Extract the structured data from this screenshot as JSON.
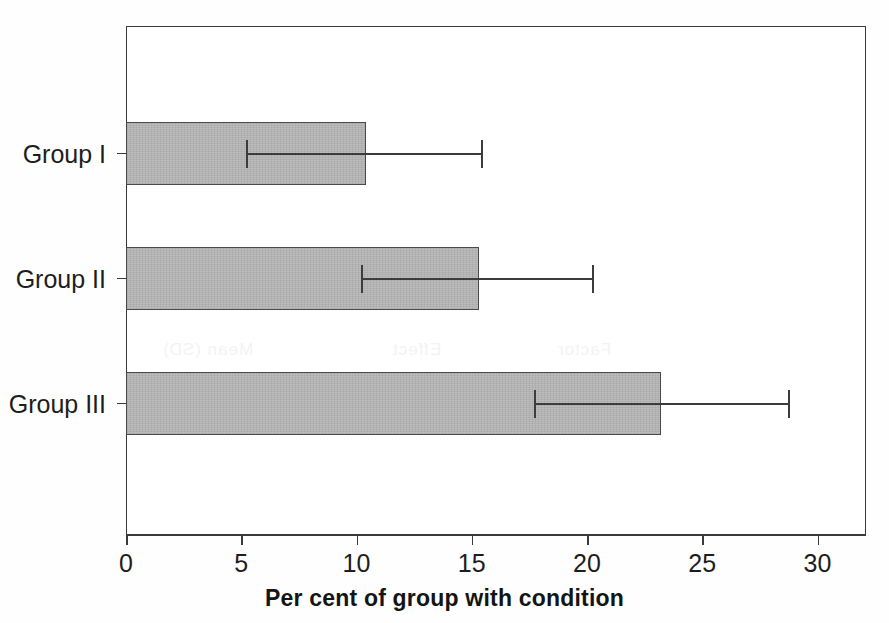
{
  "chart_data": {
    "type": "bar",
    "orientation": "horizontal",
    "title": "",
    "xlabel": "Per cent of group with condition",
    "ylabel": "",
    "categories": [
      "Group I",
      "Group II",
      "Group III"
    ],
    "values": [
      10.4,
      15.3,
      23.2
    ],
    "error_low": [
      5.2,
      10.2,
      17.7
    ],
    "error_high": [
      15.4,
      20.2,
      28.7
    ],
    "xlim": [
      0,
      32.1
    ],
    "xticks": [
      0,
      5,
      10,
      15,
      20,
      25,
      30
    ],
    "xtick_labels": [
      "0",
      "5",
      "10",
      "15",
      "20",
      "25",
      "30"
    ],
    "grid": false,
    "legend": false,
    "bar_color": "#b6b6b6",
    "bar_edge_color": "#4a4a4a",
    "error_color": "#3c3c3c",
    "axis_color": "#3a3a3a"
  },
  "bleed_text": {
    "row_header": "Mean (SD)",
    "row_effect": "Effect",
    "row_factor": "Factor"
  }
}
